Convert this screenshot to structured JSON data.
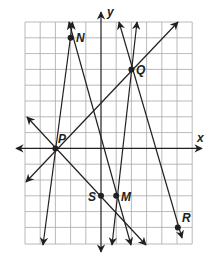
{
  "diagram": {
    "title": "",
    "axes": {
      "x_label": "x",
      "y_label": "y"
    },
    "grid": {
      "x_min": -5,
      "x_max": 6,
      "y_min": -6,
      "y_max": 8,
      "unit": 1
    },
    "points": [
      {
        "name": "N",
        "x": -2,
        "y": 7
      },
      {
        "name": "Q",
        "x": 2,
        "y": 5
      },
      {
        "name": "P",
        "x": -3,
        "y": 0
      },
      {
        "name": "S",
        "x": 0,
        "y": -3
      },
      {
        "name": "M",
        "x": 1,
        "y": -3
      },
      {
        "name": "R",
        "x": 5,
        "y": -5
      }
    ],
    "colors": {
      "line": "#231f20",
      "grid": "#9a9a9a",
      "background": "#ffffff"
    }
  }
}
